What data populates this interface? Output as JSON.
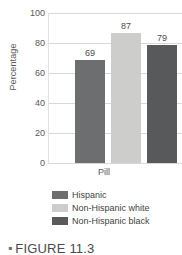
{
  "chart_data": {
    "type": "bar",
    "title": "",
    "xlabel": "Pill",
    "ylabel": "Percentage",
    "categories": [
      "Pill"
    ],
    "ylim": [
      0,
      100
    ],
    "yticks": [
      0,
      20,
      40,
      60,
      80,
      100
    ],
    "grid": true,
    "legend_position": "bottom",
    "series": [
      {
        "name": "Hispanic",
        "values": [
          69
        ],
        "color": "#6d6e70"
      },
      {
        "name": "Non-Hispanic white",
        "values": [
          87
        ],
        "color": "#cdcdcb"
      },
      {
        "name": "Non-Hispanic black",
        "values": [
          79
        ],
        "color": "#58595b"
      }
    ],
    "bars": [
      {
        "label": "Hispanic",
        "value": 69,
        "value_label": "69",
        "color": "#6d6e70"
      },
      {
        "label": "Non-Hispanic white",
        "value": 87,
        "value_label": "87",
        "color": "#cdcdcb"
      },
      {
        "label": "Non-Hispanic black",
        "value": 79,
        "value_label": "79",
        "color": "#58595b"
      }
    ]
  },
  "axes": {
    "y_title": "Percentage",
    "x_title": "Pill",
    "y_ticks": [
      "0",
      "20",
      "40",
      "60",
      "80",
      "100"
    ]
  },
  "legend": {
    "items": [
      {
        "label": "Hispanic",
        "color": "#6d6e70"
      },
      {
        "label": "Non-Hispanic white",
        "color": "#cdcdcb"
      },
      {
        "label": "Non-Hispanic black",
        "color": "#58595b"
      }
    ]
  },
  "caption": {
    "bullet": "▪",
    "text": "FIGURE 11.3"
  }
}
